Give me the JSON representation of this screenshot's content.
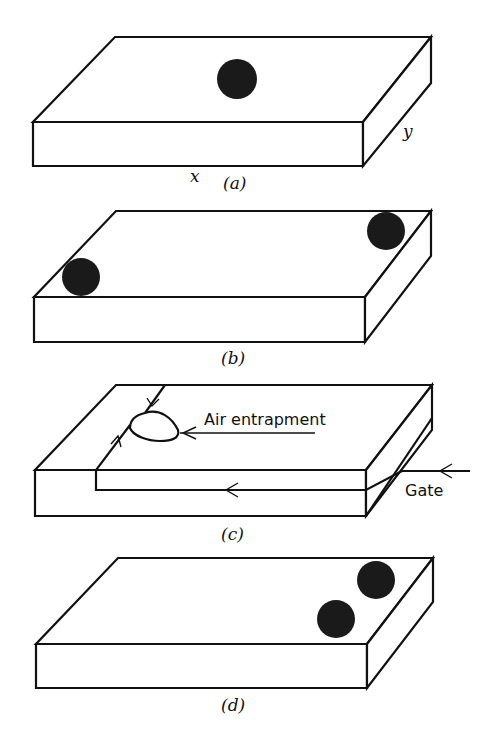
{
  "figure": {
    "panels": [
      {
        "id": "a",
        "label": "(a)",
        "description": "Single gate at center of plate",
        "dots": 1
      },
      {
        "id": "b",
        "label": "(b)",
        "description": "Two gates at opposite corners",
        "dots": 2
      },
      {
        "id": "c",
        "label": "(c)",
        "description": "Flow path from edge gate showing air entrapment",
        "dots": 0
      },
      {
        "id": "d",
        "label": "(d)",
        "description": "Two gates near one corner",
        "dots": 2
      }
    ],
    "axes": {
      "x": "x",
      "y": "y"
    },
    "annotations": {
      "air_entrapment": "Air entrapment",
      "gate": "Gate"
    },
    "colors": {
      "ink": "#111111",
      "dot": "#1a1a1a",
      "background": "#ffffff"
    }
  }
}
